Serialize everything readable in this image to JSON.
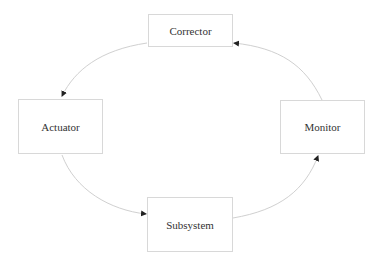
{
  "diagram": {
    "type": "cycle",
    "nodes": [
      {
        "id": "corrector",
        "label": "Corrector"
      },
      {
        "id": "actuator",
        "label": "Actuator"
      },
      {
        "id": "subsystem",
        "label": "Subsystem"
      },
      {
        "id": "monitor",
        "label": "Monitor"
      }
    ],
    "edges": [
      {
        "from": "corrector",
        "to": "actuator"
      },
      {
        "from": "actuator",
        "to": "subsystem"
      },
      {
        "from": "subsystem",
        "to": "monitor"
      },
      {
        "from": "monitor",
        "to": "corrector"
      }
    ],
    "colors": {
      "border": "#d8d8d8",
      "edge": "#d0d0d0",
      "arrowhead": "#222222",
      "text": "#333333"
    }
  }
}
